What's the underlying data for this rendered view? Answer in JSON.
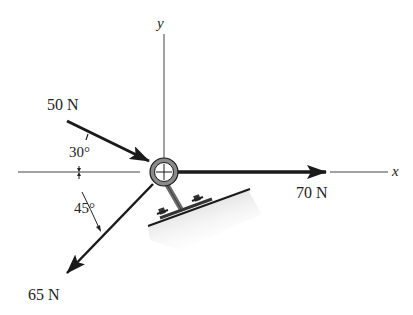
{
  "axes": {
    "x_label": "x",
    "y_label": "y"
  },
  "forces": [
    {
      "id": "f1",
      "label": "50 N",
      "magnitude": 50,
      "unit": "N",
      "angle_label": "30°",
      "angle_deg": 30,
      "direction": "toward origin from upper-left, 30° below negative x-axis"
    },
    {
      "id": "f2",
      "label": "70 N",
      "magnitude": 70,
      "unit": "N",
      "direction": "along positive x-axis"
    },
    {
      "id": "f3",
      "label": "65 N",
      "magnitude": 65,
      "unit": "N",
      "angle_label": "45°",
      "angle_deg": 45,
      "direction": "away from origin to lower-left, 45° below negative x-axis"
    }
  ],
  "colors": {
    "line": "#1a1a1a",
    "ring": "#7a7a7a",
    "shading": "#c8c8c8",
    "background": "#ffffff"
  }
}
